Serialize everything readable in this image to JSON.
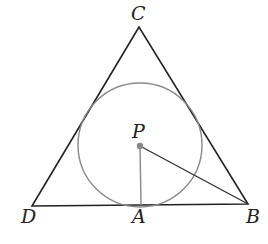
{
  "diagram": {
    "points": {
      "C": {
        "label": "C",
        "x": 139,
        "y": 27
      },
      "D": {
        "label": "D",
        "x": 32,
        "y": 206
      },
      "B": {
        "label": "B",
        "x": 248,
        "y": 204
      },
      "A": {
        "label": "A",
        "x": 141,
        "y": 205
      },
      "P": {
        "label": "P",
        "x": 140,
        "y": 146
      }
    },
    "circle": {
      "center": "P",
      "radius": 63,
      "color": "#8a8a8a"
    },
    "segments": [
      {
        "from": "C",
        "to": "D",
        "color": "#222222"
      },
      {
        "from": "C",
        "to": "B",
        "color": "#222222"
      },
      {
        "from": "D",
        "to": "B",
        "color": "#222222"
      },
      {
        "from": "P",
        "to": "A",
        "color": "#8a8a8a"
      },
      {
        "from": "P",
        "to": "B",
        "color": "#333333"
      }
    ],
    "labels": {
      "C": "C",
      "D": "D",
      "B": "B",
      "A": "A",
      "P": "P"
    }
  }
}
